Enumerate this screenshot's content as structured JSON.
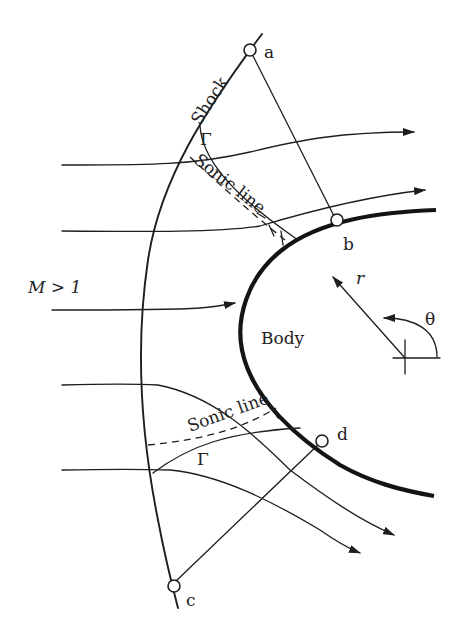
{
  "figure": {
    "labels": {
      "shock": "Shock",
      "sonic_line_upper": "Sonic line",
      "sonic_line_lower": "Sonic line",
      "gamma_upper": "Γ",
      "gamma_lower": "Γ",
      "freestream": "M > 1",
      "body": "Body",
      "r_axis": "r",
      "theta_axis": "θ"
    },
    "points": [
      {
        "id": "a",
        "label": "a",
        "location": "on shock, top"
      },
      {
        "id": "b",
        "label": "b",
        "location": "on body, upper"
      },
      {
        "id": "c",
        "label": "c",
        "location": "on shock, bottom"
      },
      {
        "id": "d",
        "label": "d",
        "location": "on body, lower"
      }
    ],
    "connections": [
      {
        "from": "a",
        "to": "b"
      },
      {
        "from": "c",
        "to": "d"
      }
    ],
    "streamline_count": 5,
    "colors": {
      "ink": "#1e1e1e",
      "background": "#ffffff"
    }
  }
}
